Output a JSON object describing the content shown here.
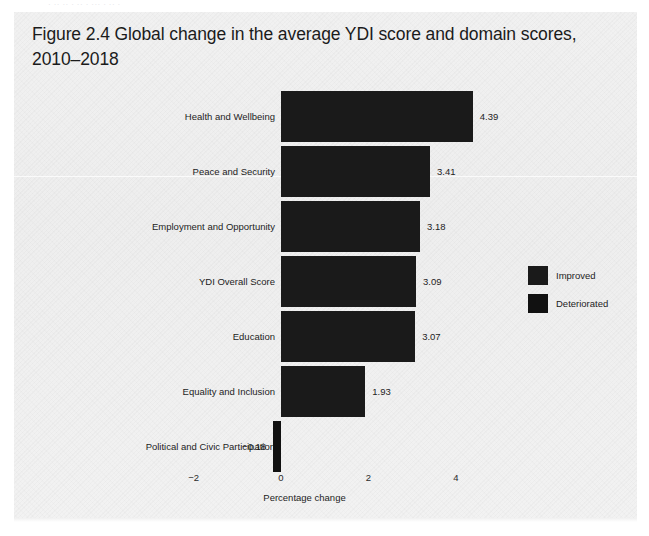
{
  "page": {
    "ghost_header": "· ·· ·· · ·· · ··· · ·· ·",
    "title_line1": "Figure 2.4  Global change in the average YDI score and domain scores,",
    "title_line2": "2010–2018",
    "background_color": "#f1f1f1"
  },
  "chart_data": {
    "type": "bar",
    "orientation": "horizontal",
    "title": "Figure 2.4  Global change in the average YDI score and domain scores, 2010–2018",
    "subtitle": "",
    "xlabel": "Percentage change",
    "ylabel": "",
    "categories": [
      "Health and Wellbeing",
      "Peace and Security",
      "Employment and Opportunity",
      "YDI Overall Score",
      "Education",
      "Equality and Inclusion",
      "Political and Civic Participation"
    ],
    "values": [
      4.39,
      3.41,
      3.18,
      3.09,
      3.07,
      1.93,
      -0.18
    ],
    "value_labels": [
      "4.39",
      "3.41",
      "3.18",
      "3.09",
      "3.07",
      "1.93",
      "−0.18"
    ],
    "point_status": [
      "Improved",
      "Improved",
      "Improved",
      "Improved",
      "Improved",
      "Improved",
      "Deteriorated"
    ],
    "xlim": [
      -2.6,
      5.2
    ],
    "xticks": [
      -2,
      0,
      2,
      4
    ],
    "xtick_labels": [
      "−2",
      "0",
      "2",
      "4"
    ],
    "grid": false,
    "legend": {
      "position": "right-middle",
      "entries": [
        {
          "label": "Improved",
          "color": "#1a1a1a"
        },
        {
          "label": "Deteriorated",
          "color": "#111111"
        }
      ]
    },
    "colors": {
      "improved": "#1a1a1a",
      "deteriorated": "#111111",
      "text": "#1d1d1d",
      "background": "#f1f1f1"
    }
  }
}
